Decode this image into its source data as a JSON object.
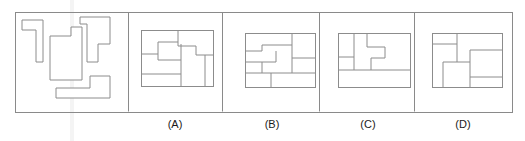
{
  "figure": {
    "type": "spatial-reasoning-assembly-puzzle",
    "canvas": {
      "width": 525,
      "height": 141
    },
    "outer_frame": {
      "x": 15,
      "y": 12,
      "width": 497,
      "height": 100
    },
    "dividers_x": [
      128,
      222,
      319,
      414
    ],
    "stroke_color": "#8c8c8c",
    "frame_color": "#8a8a8a",
    "label_color": "#1a1a1a",
    "background_color": "#ffffff",
    "prompt_panel": {
      "name": "pieces-panel",
      "label": "",
      "pieces": [
        {
          "name": "piece-j-shape",
          "description": "tall narrow J / hook shape, open notch on upper right",
          "points": "22,20 43,20 43,62 36,62 36,30 22,30"
        },
        {
          "name": "piece-notched-rectangle",
          "description": "rectangle with a small step cut out of the top-left corner",
          "points": "50,36 71,36 71,27 82,27 82,80 50,80"
        },
        {
          "name": "piece-stepped-tall",
          "description": "tall stepped piece, wide at top, narrowing twice toward bottom",
          "points": "80,17 110,17 110,44 98,44 98,62 87,62 87,24 80,24"
        },
        {
          "name": "piece-l-shape",
          "description": "L shape lying on its side, foot extending to the left",
          "points": "90,76 110,76 110,98 56,98 56,88 90,88"
        }
      ]
    },
    "options": [
      {
        "name": "option-a",
        "label": "(A)",
        "label_x": 175,
        "label_y": 128,
        "box": {
          "x": 141,
          "y": 30,
          "width": 72,
          "height": 56
        },
        "internal_paths": [
          "M 141 54 L 158 54 L 158 42 L 178 42",
          "M 178 30 L 178 46 L 196 46 L 196 55 L 213 55",
          "M 158 54 L 158 60 L 181 60",
          "M 181 44 L 181 86",
          "M 141 74 L 181 74",
          "M 205 55 L 205 86"
        ]
      },
      {
        "name": "option-b",
        "label": "(B)",
        "label_x": 272,
        "label_y": 128,
        "box": {
          "x": 245,
          "y": 33,
          "width": 70,
          "height": 54
        },
        "internal_paths": [
          "M 245 51 L 262 51 L 262 45 L 292 45",
          "M 292 33 L 292 45",
          "M 292 45 L 292 73 L 315 73",
          "M 245 62 L 276 62 L 276 51",
          "M 262 62 L 262 73 L 292 73",
          "M 245 73 L 262 73",
          "M 271 73 L 271 87",
          "M 292 58 L 315 58"
        ]
      },
      {
        "name": "option-c",
        "label": "(C)",
        "label_x": 368,
        "label_y": 128,
        "box": {
          "x": 338,
          "y": 33,
          "width": 72,
          "height": 54
        },
        "internal_paths": [
          "M 338 57 L 354 57 L 354 33",
          "M 367 33 L 367 47 L 385 47 L 385 58 L 371 58",
          "M 371 58 L 371 70 L 410 70",
          "M 338 70 L 371 70",
          "M 354 57 L 354 70"
        ]
      },
      {
        "name": "option-d",
        "label": "(D)",
        "label_x": 463,
        "label_y": 128,
        "box": {
          "x": 432,
          "y": 33,
          "width": 70,
          "height": 54
        },
        "internal_paths": [
          "M 432 44 L 457 44 L 457 62 L 443 62 L 443 87",
          "M 457 62 L 470 62",
          "M 470 50 L 470 87",
          "M 470 50 L 502 50",
          "M 470 77 L 502 77",
          "M 457 44 L 457 33"
        ]
      }
    ]
  }
}
